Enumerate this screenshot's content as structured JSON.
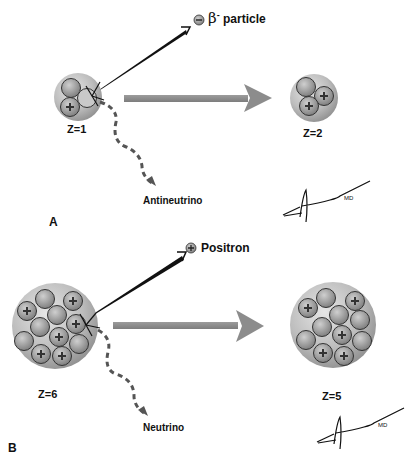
{
  "panels": {
    "A": {
      "letter": "A",
      "emitted_particle": {
        "symbol": "β",
        "superscript": "-",
        "name": "particle",
        "charge_glyph": "−"
      },
      "parent": {
        "label": "Z=1",
        "nucleons": {
          "protons": 1,
          "neutrons": 2
        }
      },
      "daughter": {
        "label": "Z=2",
        "nucleons": {
          "protons": 2,
          "neutrons": 1
        }
      },
      "neutrino_label": "Antineutrino",
      "signature": "Alyami MD"
    },
    "B": {
      "letter": "B",
      "emitted_particle": {
        "name": "Positron",
        "charge_glyph": "+"
      },
      "parent": {
        "label": "Z=6",
        "nucleons": {
          "protons": 6,
          "neutrons": 6
        }
      },
      "daughter": {
        "label": "Z=5",
        "nucleons": {
          "protons": 5,
          "neutrons": 7
        }
      },
      "neutrino_label": "Neutrino",
      "signature": "Alyami MD"
    }
  },
  "colors": {
    "nucleus_fill": "#b9b9b9",
    "nucleon_fill": "#8f8f8f",
    "arrow_gray": "#8a8a8a",
    "emission_arrow": "#111111",
    "text": "#111111"
  }
}
